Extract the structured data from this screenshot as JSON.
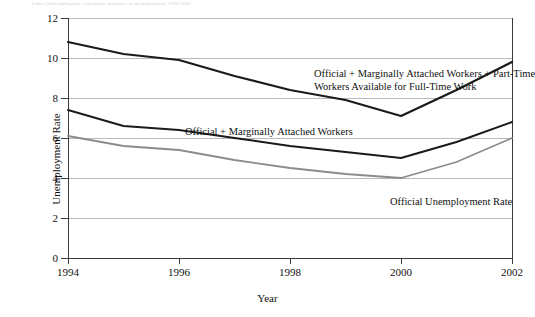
{
  "figure": {
    "top_caption": "Labor Underutilization: Alternative measures of unemployment, 1994-2002"
  },
  "axes": {
    "y_title": "Unemployment Rate",
    "x_title": "Year",
    "y_ticks": [
      "0",
      "2",
      "4",
      "6",
      "8",
      "10",
      "12"
    ],
    "x_ticks": [
      "1994",
      "1996",
      "1998",
      "2000",
      "2002"
    ]
  },
  "annotations": {
    "broadest_line1": "Official + Marginally Attached Workers + Part-Time",
    "broadest_line2": "Workers Available for Full-Time Work",
    "marginal": "Official + Marginally Attached Workers",
    "official": "Official Unemployment Rate"
  },
  "colors": {
    "dark_line": "#1a1a1a",
    "gray_line": "#8c8c8c",
    "grid": "#b9b9bd",
    "axis": "#3a3a3a",
    "background": "#ffffff"
  },
  "chart_data": {
    "type": "line",
    "title": "",
    "xlabel": "Year",
    "ylabel": "Unemployment Rate",
    "x": [
      1994,
      1995,
      1996,
      1997,
      1998,
      1999,
      2000,
      2001,
      2002
    ],
    "xlim": [
      1994,
      2002
    ],
    "ylim": [
      0,
      12
    ],
    "yticks": [
      0,
      2,
      4,
      6,
      8,
      10,
      12
    ],
    "xticks": [
      1994,
      1996,
      1998,
      2000,
      2002
    ],
    "grid": "horizontal",
    "legend": "inline-annotations",
    "series": [
      {
        "name": "Official + Marginally Attached Workers + Part-Time Workers Available for Full-Time Work",
        "color": "#1a1a1a",
        "width": 2.2,
        "values": [
          10.8,
          10.2,
          9.9,
          9.1,
          8.4,
          7.9,
          7.1,
          8.4,
          9.8
        ]
      },
      {
        "name": "Official + Marginally Attached Workers",
        "color": "#1a1a1a",
        "width": 2.0,
        "values": [
          7.4,
          6.6,
          6.4,
          6.0,
          5.6,
          5.3,
          5.0,
          5.8,
          6.8
        ]
      },
      {
        "name": "Official Unemployment Rate",
        "color": "#8c8c8c",
        "width": 1.8,
        "values": [
          6.1,
          5.6,
          5.4,
          4.9,
          4.5,
          4.2,
          4.0,
          4.8,
          6.0
        ]
      }
    ]
  }
}
